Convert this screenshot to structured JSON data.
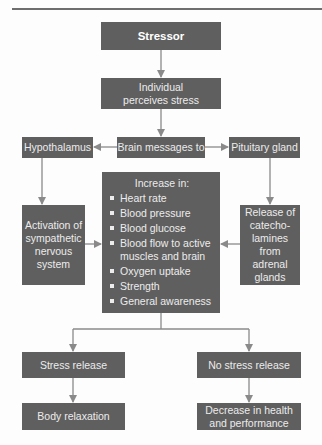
{
  "header": {
    "partial_text": "Chapter"
  },
  "diagram": {
    "stressor": "Stressor",
    "perceives": "Individual perceives stress",
    "brain_messages": "Brain messages to",
    "hypothalamus": "Hypothalamus",
    "pituitary": "Pituitary gland",
    "activation": "Activation of sympathetic nervous system",
    "release": "Release of catecho-lamines from adrenal glands",
    "increase": {
      "title": "Increase in:",
      "items": [
        "Heart rate",
        "Blood pressure",
        "Blood glucose",
        "Blood flow to active muscles and brain",
        "Oxygen uptake",
        "Strength",
        "General awareness"
      ]
    },
    "stress_release": "Stress release",
    "no_stress_release": "No stress release",
    "body_relaxation": "Body relaxation",
    "decrease": "Decrease in health and performance"
  },
  "colors": {
    "box": "#5f5f5f",
    "text": "#ececec",
    "arrow": "#8a8a8a",
    "rule": "#6e6e6e"
  }
}
